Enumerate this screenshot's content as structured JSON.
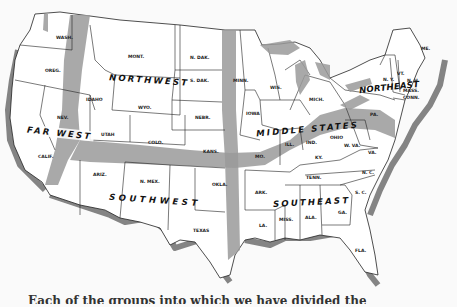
{
  "map": {
    "title": "Map of the United States by regions",
    "regions": [
      {
        "id": "northwest",
        "label": "NORTHWEST"
      },
      {
        "id": "far-west",
        "label": "FAR WEST"
      },
      {
        "id": "middle-states",
        "label": "MIDDLE STATES"
      },
      {
        "id": "northeast",
        "label": "NORTHEAST"
      },
      {
        "id": "southwest",
        "label": "SOUTHWEST"
      },
      {
        "id": "southeast",
        "label": "SOUTHEAST"
      }
    ],
    "states": {
      "wash": "WASH.",
      "oreg": "OREG.",
      "calif": "CALIF.",
      "nev": "NEV.",
      "idaho": "IDAHO",
      "mont": "MONT.",
      "wyo": "WYO.",
      "utah": "UTAH",
      "colo": "COLO.",
      "ariz": "ARIZ.",
      "nmex": "N. MEX.",
      "ndak": "N. DAK.",
      "sdak": "S. DAK.",
      "nebr": "NEBR.",
      "kans": "KANS.",
      "okla": "OKLA.",
      "texas": "TEXAS",
      "minn": "MINN.",
      "iowa": "IOWA",
      "mo": "MO.",
      "ark": "ARK.",
      "la": "LA.",
      "wis": "WIS.",
      "mich": "MICH.",
      "ill": "ILL.",
      "ind": "IND.",
      "ohio": "OHIO",
      "ky": "KY.",
      "tenn": "TENN.",
      "miss": "MISS.",
      "ala": "ALA.",
      "ga": "GA.",
      "fla": "FLA.",
      "sc": "S. C.",
      "nc": "N. C.",
      "va": "VA.",
      "wva": "W. VA.",
      "pa": "PA.",
      "ny": "N. Y.",
      "vt": "VT.",
      "nh": "N. H.",
      "mass": "MASS.",
      "conn": "CONN.",
      "me": "ME."
    },
    "colors": {
      "shading": "#9a9a9a",
      "outline": "#222222",
      "land": "#ffffff",
      "paper": "#fafafa"
    }
  },
  "caption": {
    "text": "Each of the groups into which we have divided the"
  }
}
